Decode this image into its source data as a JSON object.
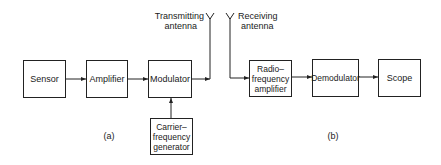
{
  "diagram": {
    "transmitter": {
      "caption": "(a)",
      "blocks": [
        {
          "id": "sensor",
          "label": "Sensor"
        },
        {
          "id": "amplifier",
          "label": "Amplifier"
        },
        {
          "id": "modulator",
          "label": "Modulator"
        },
        {
          "id": "carrier",
          "label_lines": [
            "Carrier–",
            "frequency",
            "generator"
          ]
        }
      ],
      "antenna": {
        "label_lines": [
          "Transmitting",
          "antenna"
        ]
      }
    },
    "receiver": {
      "caption": "(b)",
      "antenna": {
        "label_lines": [
          "Receiving",
          "antenna"
        ]
      },
      "blocks": [
        {
          "id": "rf-amplifier",
          "label_lines": [
            "Radio–",
            "frequency",
            "amplifier"
          ]
        },
        {
          "id": "demodulator",
          "label": "Demodulator"
        },
        {
          "id": "scope",
          "label": "Scope"
        }
      ]
    },
    "connections": [
      {
        "from": "sensor",
        "to": "amplifier"
      },
      {
        "from": "amplifier",
        "to": "modulator"
      },
      {
        "from": "carrier",
        "to": "modulator"
      },
      {
        "from": "modulator",
        "to": "transmitting-antenna"
      },
      {
        "from": "receiving-antenna",
        "to": "rf-amplifier"
      },
      {
        "from": "rf-amplifier",
        "to": "demodulator"
      },
      {
        "from": "demodulator",
        "to": "scope"
      }
    ]
  }
}
